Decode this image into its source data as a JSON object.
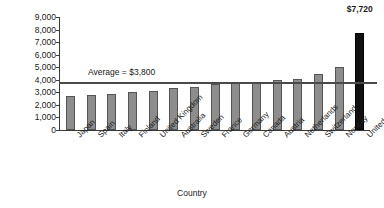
{
  "chart_data": {
    "type": "bar",
    "title": "",
    "xlabel": "Country",
    "ylabel": "Per capita spending ($)",
    "ylim": [
      0,
      9000
    ],
    "ytick_labels": [
      "0",
      "1,000",
      "2,000",
      "3,000",
      "4,000",
      "5,000",
      "6,000",
      "7,000",
      "8,000",
      "9,000"
    ],
    "ytick_values": [
      0,
      1000,
      2000,
      3000,
      4000,
      5000,
      6000,
      7000,
      8000,
      9000
    ],
    "grid": false,
    "legend": "none",
    "categories": [
      "Japan",
      "Spain",
      "Italy",
      "Finland",
      "United Kingdom",
      "Australia",
      "Sweden",
      "France",
      "Germany",
      "Canada",
      "Austria",
      "Netherlands",
      "Switzerland",
      "Norway",
      "United States"
    ],
    "values": [
      2700,
      2750,
      2850,
      3000,
      3100,
      3350,
      3450,
      3700,
      3750,
      3850,
      4000,
      4100,
      4500,
      5000,
      7720
    ],
    "bar_colors": [
      "#8d8d8d",
      "#8d8d8d",
      "#8d8d8d",
      "#8d8d8d",
      "#8d8d8d",
      "#8d8d8d",
      "#8d8d8d",
      "#8d8d8d",
      "#8d8d8d",
      "#8d8d8d",
      "#8d8d8d",
      "#8d8d8d",
      "#8d8d8d",
      "#8d8d8d",
      "#111111"
    ],
    "data_labels": [
      "",
      "",
      "",
      "",
      "",
      "",
      "",
      "",
      "",
      "",
      "",
      "",
      "",
      "",
      "$7,720"
    ],
    "reference_line": {
      "label": "Average = $3,800",
      "value": 3800
    }
  },
  "colors": {
    "bar_fill": "#8d8d8d",
    "bar_stroke": "#555555",
    "highlight_fill": "#111111",
    "axis": "#3a3a3a",
    "reference_line": "#4a4a4a",
    "background": "#ffffff"
  }
}
